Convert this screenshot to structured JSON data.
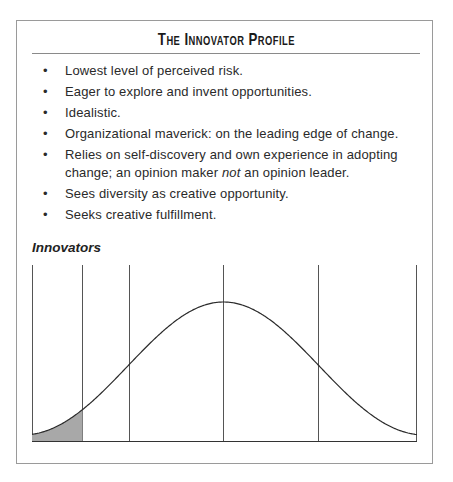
{
  "panel": {
    "title": "The Innovator Profile",
    "bullets": [
      {
        "text": "Lowest level of perceived risk."
      },
      {
        "text": "Eager to explore and invent opportunities."
      },
      {
        "text": "Idealistic."
      },
      {
        "text": "Organizational maverick: on the leading edge of change."
      },
      {
        "text_before": "Relies on self-discovery and own experience in adopting change; an opinion maker ",
        "emphasis": "not",
        "text_after": " an opinion leader."
      },
      {
        "text": "Sees diversity as creative opportunity."
      },
      {
        "text": "Seeks creative fulfillment."
      }
    ],
    "bullet_glyph": "•"
  },
  "chart_data": {
    "type": "area",
    "title": "Innovators",
    "segment_boundaries_sigma": [
      -2,
      -1.5,
      -1,
      0,
      1,
      2
    ],
    "segments": [
      "Innovators",
      "Early Adopters",
      "Early Majority",
      "Late Majority",
      "Laggards"
    ],
    "highlighted_segment": "Innovators",
    "highlight_color": "#a8a8a8",
    "line_color": "#333333",
    "grid": false,
    "xlabel": "",
    "ylabel": ""
  }
}
